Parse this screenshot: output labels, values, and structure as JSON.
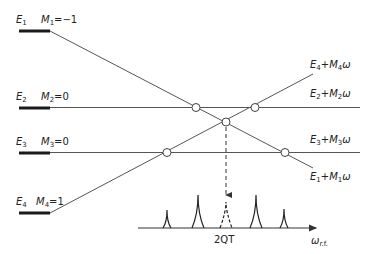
{
  "diagram": {
    "colors": {
      "line": "#555555",
      "bar": "#1a1a1a",
      "text": "#222222"
    },
    "levels": [
      {
        "energy": "E",
        "index": "1",
        "m_label": "M",
        "m_index": "1",
        "m_value": "=−1",
        "right": {
          "e": "E",
          "ei": "1",
          "m": "M",
          "mi": "1",
          "w": "ω",
          "plus": "+"
        }
      },
      {
        "energy": "E",
        "index": "2",
        "m_label": "M",
        "m_index": "2",
        "m_value": "=0",
        "right": {
          "e": "E",
          "ei": "2",
          "m": "M",
          "mi": "2",
          "w": "ω",
          "plus": "+"
        }
      },
      {
        "energy": "E",
        "index": "3",
        "m_label": "M",
        "m_index": "3",
        "m_value": "=0",
        "right": {
          "e": "E",
          "ei": "3",
          "m": "M",
          "mi": "3",
          "w": "ω",
          "plus": "+"
        }
      },
      {
        "energy": "E",
        "index": "4",
        "m_label": "M",
        "m_index": "4",
        "m_value": "=1",
        "right": {
          "e": "E",
          "ei": "4",
          "m": "M",
          "mi": "4",
          "w": "ω",
          "plus": "+"
        }
      }
    ],
    "spectrum": {
      "center_label": "2QT",
      "axis_label": "ω",
      "axis_sub": "r.f.",
      "peaks": [
        {
          "x": 167,
          "height": 18,
          "style": "solid"
        },
        {
          "x": 198,
          "height": 33,
          "style": "solid"
        },
        {
          "x": 226,
          "height": 26,
          "style": "dashed"
        },
        {
          "x": 256,
          "height": 33,
          "style": "solid"
        },
        {
          "x": 284,
          "height": 19,
          "style": "solid"
        }
      ]
    },
    "crossings": [
      {
        "x": 196,
        "y": 107
      },
      {
        "x": 255,
        "y": 107
      },
      {
        "x": 226,
        "y": 122
      },
      {
        "x": 167,
        "y": 152
      },
      {
        "x": 285,
        "y": 152
      }
    ]
  }
}
